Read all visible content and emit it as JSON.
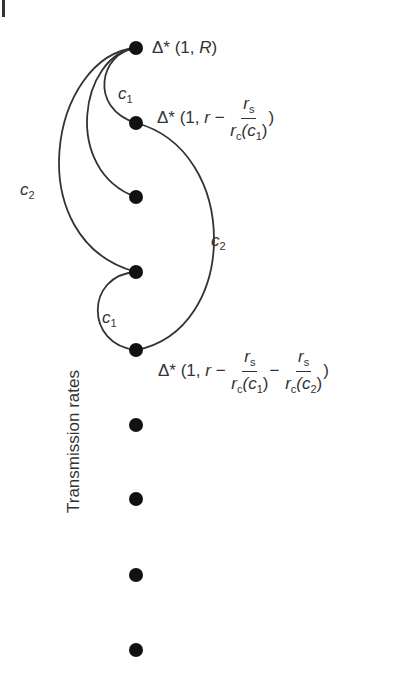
{
  "diagram": {
    "axis_label": "Transmission rates",
    "nodes": [
      {
        "id": "n1",
        "y": 48,
        "label": "Δ* (1, R)"
      },
      {
        "id": "n2",
        "y": 123,
        "label": "Δ* (1, r − r_s / r_c(c_1))"
      },
      {
        "id": "n3",
        "y": 197
      },
      {
        "id": "n4",
        "y": 272
      },
      {
        "id": "n5",
        "y": 350,
        "label": "Δ* (1, r − r_s / r_c(c_1) − r_s / r_c(c_2))"
      },
      {
        "id": "n6",
        "y": 425
      },
      {
        "id": "n7",
        "y": 499
      },
      {
        "id": "n8",
        "y": 575
      },
      {
        "id": "n9",
        "y": 650
      }
    ],
    "edges": [
      {
        "from": "n1",
        "to": "n2",
        "label": "c1"
      },
      {
        "from": "n1",
        "to": "n3",
        "label": ""
      },
      {
        "from": "n1",
        "to": "n4",
        "label": "c2"
      },
      {
        "from": "n2",
        "to": "n5",
        "label": "c2"
      },
      {
        "from": "n4",
        "to": "n5",
        "label": "c1"
      }
    ],
    "labels": {
      "n1": {
        "prefix": "Δ* (1, ",
        "var": "R",
        "suffix": ")"
      },
      "n2": {
        "prefix": "Δ* (1, ",
        "r": "r",
        "minus": " − ",
        "num": "r",
        "num_sub": "s",
        "den": "r",
        "den_sub": "c",
        "den_arg_open": "(c",
        "den_arg_sub": "1",
        "den_arg_close": ")",
        "suffix": ")"
      },
      "n5": {
        "prefix": "Δ* (1, ",
        "r": "r",
        "minus": " − ",
        "num": "r",
        "num_sub": "s",
        "den": "r",
        "den_sub": "c",
        "den_arg_open": "(c",
        "den_arg_sub": "1",
        "den_arg_close": ")",
        "minus2": "−",
        "num2": "r",
        "num2_sub": "s",
        "den2": "r",
        "den2_sub": "c",
        "den2_arg_open": "(c",
        "den2_arg_sub": "2",
        "den2_arg_close": ")",
        "suffix": ")"
      }
    },
    "edge_labels": {
      "c1_top": {
        "c": "c",
        "sub": "1"
      },
      "c2_left": {
        "c": "c",
        "sub": "2"
      },
      "c2_right": {
        "c": "c",
        "sub": "2"
      },
      "c1_bottom": {
        "c": "c",
        "sub": "1"
      }
    }
  }
}
